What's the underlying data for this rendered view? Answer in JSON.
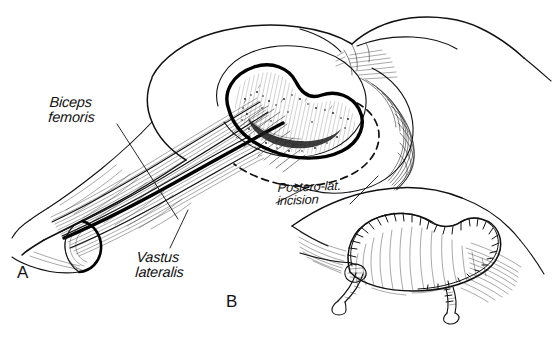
{
  "figure": {
    "background_color": "#ffffff",
    "ink_color": "#111111",
    "width": 553,
    "height": 338,
    "style": "pen-and-ink surgical line drawing with hatching and stipple"
  },
  "labels": {
    "biceps_femoris": "Biceps\nfemoris",
    "vastus_lateralis": "Vastus\nlateralis",
    "postero_lat_incision": "Postero-lat.\nincision"
  },
  "panels": {
    "a": "A",
    "b": "B"
  },
  "panel_a": {
    "caption_letter": "A",
    "features": [
      "patient in lateral decubitus position, hip and thigh exposed",
      "kidney-shaped posterolateral soft-tissue defect with heavy outlined margin",
      "stippled and hatched wound bed inside the defect",
      "dashed posterolateral incision line curving distally from the defect",
      "biceps femoris muscle belly elevated with long tendon",
      "vastus lateralis muscle lying anterior to the septum",
      "heavy black line marking the intermuscular septum",
      "divided distal muscle end shown in cross-section as an ellipse"
    ]
  },
  "panel_b": {
    "caption_letter": "B",
    "features": [
      "completed flap inset with wound closed",
      "interrupted suture marks along the curved closure line",
      "two closed-suction drain tubes exiting inferiorly",
      "radiating hatching indicating skin tension and contour"
    ]
  }
}
